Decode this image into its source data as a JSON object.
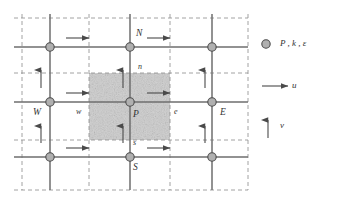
{
  "figure": {
    "type": "staggered-grid-control-volume-diagram",
    "nodes": [
      {
        "id": "n-nw",
        "label": "",
        "x": 50,
        "y": 47
      },
      {
        "id": "n-n",
        "label": "N",
        "x": 130,
        "y": 47,
        "label_x": 136,
        "label_y": 34
      },
      {
        "id": "n-ne",
        "label": "",
        "x": 212,
        "y": 47
      },
      {
        "id": "n-w",
        "label": "W",
        "x": 50,
        "y": 102,
        "label_x": 36,
        "label_y": 113
      },
      {
        "id": "n-p",
        "label": "P",
        "x": 130,
        "y": 102,
        "label_x": 134,
        "label_y": 115
      },
      {
        "id": "n-e",
        "label": "E",
        "x": 212,
        "y": 102,
        "label_x": 220,
        "label_y": 113
      },
      {
        "id": "n-sw",
        "label": "",
        "x": 50,
        "y": 157
      },
      {
        "id": "n-s",
        "label": "S",
        "x": 130,
        "y": 157,
        "label_x": 134,
        "label_y": 170
      },
      {
        "id": "n-se",
        "label": "",
        "x": 212,
        "y": 157
      }
    ],
    "face_labels": [
      {
        "id": "face-w",
        "text": "w",
        "x": 78,
        "y": 113
      },
      {
        "id": "face-e",
        "text": "e",
        "x": 175,
        "y": 113
      },
      {
        "id": "face-n",
        "text": "n",
        "x": 139,
        "y": 67
      },
      {
        "id": "face-s",
        "text": "s",
        "x": 134,
        "y": 143
      }
    ],
    "solid_grid": {
      "vertical_x": [
        50,
        130,
        212
      ],
      "horizontal_y": [
        47,
        102,
        157
      ],
      "x_min": 14,
      "x_max": 248,
      "y_min": 14,
      "y_max": 190,
      "color": "#6e6e6e"
    },
    "dashed_grid": {
      "vertical_x": [
        22,
        89,
        170,
        248
      ],
      "horizontal_y": [
        18,
        73,
        140,
        190
      ],
      "color": "#8a8a8a"
    },
    "control_volume": {
      "x": 89,
      "y": 73,
      "width": 81,
      "height": 67,
      "fill": "#c9c9c9",
      "border": "dashed"
    },
    "node_style": {
      "radius": 4.2,
      "fill": "#b0b0b0",
      "stroke": "#4a4a4a"
    },
    "u_arrows": [
      {
        "x": 76,
        "y": 38
      },
      {
        "x": 148,
        "y": 38
      },
      {
        "x": 76,
        "y": 93
      },
      {
        "x": 148,
        "y": 93
      },
      {
        "x": 76,
        "y": 148
      },
      {
        "x": 148,
        "y": 148
      }
    ],
    "v_arrows": [
      {
        "x": 41,
        "y": 88
      },
      {
        "x": 123,
        "y": 88
      },
      {
        "x": 205,
        "y": 88
      },
      {
        "x": 41,
        "y": 143
      },
      {
        "x": 123,
        "y": 143
      },
      {
        "x": 205,
        "y": 143
      }
    ]
  },
  "legend": {
    "items": [
      {
        "id": "legend-node",
        "symbol": "circle",
        "text": "P , k , ε",
        "x": 266,
        "y": 44
      },
      {
        "id": "legend-u",
        "symbol": "h-arrow",
        "text": "u",
        "x": 266,
        "y": 86
      },
      {
        "id": "legend-v",
        "symbol": "v-arrow",
        "text": "v",
        "x": 266,
        "y": 130
      }
    ]
  }
}
